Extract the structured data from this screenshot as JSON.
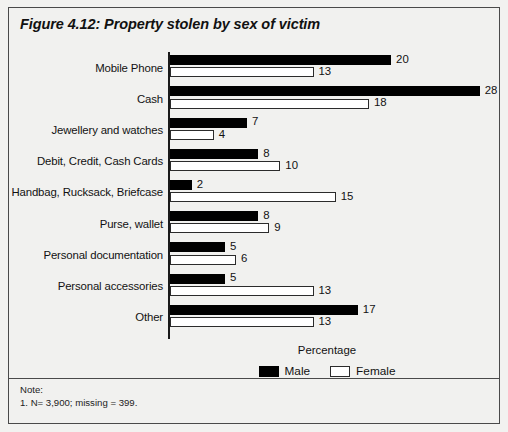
{
  "figure": {
    "title": "Figure 4.12:  Property stolen by sex of victim",
    "note_heading": "Note:",
    "note_line": "1. N= 3,900; missing = 399."
  },
  "chart_data": {
    "type": "bar",
    "orientation": "horizontal",
    "title": "Figure 4.12:  Property stolen by sex of victim",
    "xlabel": "Percentage",
    "ylabel": "",
    "xlim": [
      0,
      28
    ],
    "grid": false,
    "legend_position": "bottom-center",
    "categories": [
      "Mobile Phone",
      "Cash",
      "Jewellery and watches",
      "Debit, Credit, Cash Cards",
      "Handbag, Rucksack, Briefcase",
      "Purse, wallet",
      "Personal documentation",
      "Personal accessories",
      "Other"
    ],
    "series": [
      {
        "name": "Male",
        "color": "#000000",
        "values": [
          20,
          28,
          7,
          8,
          2,
          8,
          5,
          5,
          17
        ]
      },
      {
        "name": "Female",
        "color": "#ffffff",
        "values": [
          13,
          18,
          4,
          10,
          15,
          9,
          6,
          13,
          13
        ]
      }
    ]
  }
}
